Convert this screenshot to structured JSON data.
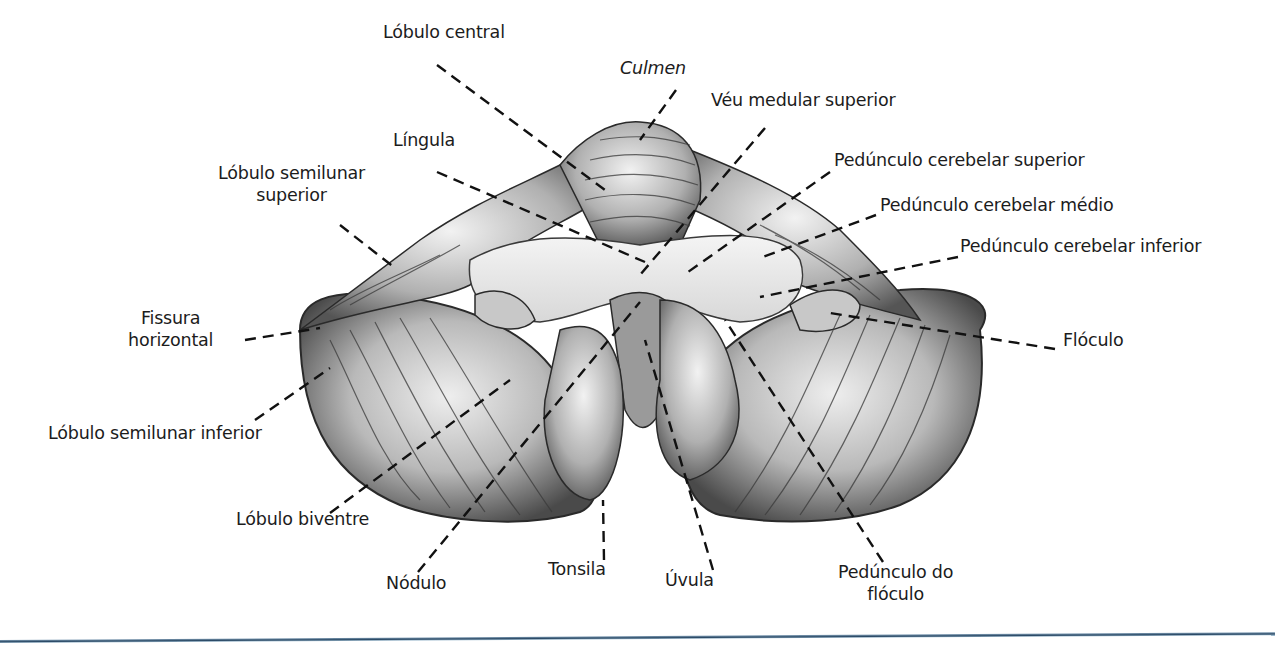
{
  "figure": {
    "accent_rule_color": "#2b4a66",
    "labels": [
      {
        "id": "lobulo-central",
        "text": "Lóbulo central",
        "x": 383,
        "y": 32,
        "align": "left"
      },
      {
        "id": "culmen",
        "text": "Culmen",
        "x": 620,
        "y": 68,
        "align": "left",
        "italic": true
      },
      {
        "id": "veu-medular-superior",
        "text": "Véu medular superior",
        "x": 711,
        "y": 100,
        "align": "left"
      },
      {
        "id": "lingula",
        "text": "Língula",
        "x": 393,
        "y": 140,
        "align": "left"
      },
      {
        "id": "pedunculo-cerebelar-superior",
        "text": "Pedúnculo cerebelar superior",
        "x": 834,
        "y": 160,
        "align": "left"
      },
      {
        "id": "lobulo-semilunar-superior",
        "text": "Lóbulo semilunar\nsuperior",
        "x": 218,
        "y": 173,
        "align": "center"
      },
      {
        "id": "pedunculo-cerebelar-medio",
        "text": "Pedúnculo cerebelar médio",
        "x": 880,
        "y": 205,
        "align": "left"
      },
      {
        "id": "pedunculo-cerebelar-inferior",
        "text": "Pedúnculo cerebelar inferior",
        "x": 960,
        "y": 246,
        "align": "left"
      },
      {
        "id": "fissura-horizontal",
        "text": "Fissura\nhorizontal",
        "x": 128,
        "y": 318,
        "align": "center"
      },
      {
        "id": "floculo",
        "text": "Flóculo",
        "x": 1063,
        "y": 340,
        "align": "left"
      },
      {
        "id": "lobulo-semilunar-inferior",
        "text": "Lóbulo semilunar inferior",
        "x": 48,
        "y": 433,
        "align": "left"
      },
      {
        "id": "lobulo-biventre",
        "text": "Lóbulo biventre",
        "x": 236,
        "y": 519,
        "align": "left"
      },
      {
        "id": "nodulo",
        "text": "Nódulo",
        "x": 386,
        "y": 583,
        "align": "left"
      },
      {
        "id": "tonsila",
        "text": "Tonsila",
        "x": 548,
        "y": 569,
        "align": "left"
      },
      {
        "id": "uvula",
        "text": "Úvula",
        "x": 665,
        "y": 580,
        "align": "left"
      },
      {
        "id": "pedunculo-do-floculo",
        "text": "Pedúnculo do\nflóculo",
        "x": 838,
        "y": 572,
        "align": "center"
      }
    ],
    "leader_lines": [
      {
        "for": "lobulo-central",
        "x1": 437,
        "y1": 65,
        "x2": 605,
        "y2": 190
      },
      {
        "for": "culmen",
        "x1": 676,
        "y1": 90,
        "x2": 640,
        "y2": 140
      },
      {
        "for": "veu-medular-superior",
        "x1": 765,
        "y1": 128,
        "x2": 640,
        "y2": 275
      },
      {
        "for": "lingula",
        "x1": 437,
        "y1": 172,
        "x2": 645,
        "y2": 262
      },
      {
        "for": "pedunculo-cerebelar-superior",
        "x1": 830,
        "y1": 172,
        "x2": 688,
        "y2": 272
      },
      {
        "for": "lobulo-semilunar-superior",
        "x1": 340,
        "y1": 225,
        "x2": 395,
        "y2": 268
      },
      {
        "for": "pedunculo-cerebelar-medio",
        "x1": 876,
        "y1": 215,
        "x2": 760,
        "y2": 258
      },
      {
        "for": "pedunculo-cerebelar-inferior",
        "x1": 958,
        "y1": 257,
        "x2": 760,
        "y2": 297
      },
      {
        "for": "fissura-horizontal",
        "x1": 245,
        "y1": 340,
        "x2": 320,
        "y2": 328
      },
      {
        "for": "floculo",
        "x1": 1055,
        "y1": 349,
        "x2": 830,
        "y2": 313
      },
      {
        "for": "lobulo-semilunar-inferior",
        "x1": 255,
        "y1": 420,
        "x2": 330,
        "y2": 368
      },
      {
        "for": "lobulo-biventre",
        "x1": 330,
        "y1": 513,
        "x2": 510,
        "y2": 380
      },
      {
        "for": "nodulo",
        "x1": 418,
        "y1": 572,
        "x2": 640,
        "y2": 302
      },
      {
        "for": "tonsila",
        "x1": 604,
        "y1": 560,
        "x2": 603,
        "y2": 500
      },
      {
        "for": "uvula",
        "x1": 713,
        "y1": 570,
        "x2": 645,
        "y2": 340
      },
      {
        "for": "pedunculo-do-floculo",
        "x1": 883,
        "y1": 562,
        "x2": 725,
        "y2": 320
      }
    ]
  }
}
